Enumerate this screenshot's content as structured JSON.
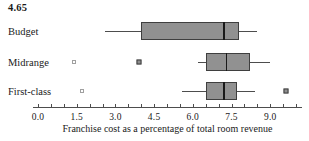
{
  "chart_data": {
    "type": "boxplot",
    "orientation": "horizontal",
    "title": "4.65",
    "xlabel": "Franchise cost as a percentage of total room revenue",
    "xlim": [
      0,
      10.3
    ],
    "x_major_ticks": [
      0.0,
      1.5,
      3.0,
      4.5,
      6.0,
      7.5,
      9.0
    ],
    "x_tick_labels": [
      "0.0",
      "1.5",
      "3.0",
      "4.5",
      "6.0",
      "7.5",
      "9.0"
    ],
    "minor_tick_step": 0.5,
    "grid": false,
    "categories": [
      "Budget",
      "Midrange",
      "First-class"
    ],
    "series": [
      {
        "name": "Budget",
        "whisker_low": 2.6,
        "q1": 4.0,
        "median": 7.2,
        "q3": 7.8,
        "whisker_high": 8.5,
        "outliers_open": [],
        "outliers_filled": []
      },
      {
        "name": "Midrange",
        "whisker_low": 6.2,
        "q1": 6.5,
        "median": 7.3,
        "q3": 8.2,
        "whisker_high": 9.0,
        "outliers_open": [
          1.4
        ],
        "outliers_filled": [
          3.9
        ]
      },
      {
        "name": "First-class",
        "whisker_low": 5.6,
        "q1": 6.5,
        "median": 7.2,
        "q3": 7.7,
        "whisker_high": 8.4,
        "outliers_open": [
          1.7
        ],
        "outliers_filled": [
          9.6
        ]
      }
    ],
    "colors": {
      "background": "#ffffff",
      "text": "#1a1a1a",
      "box_fill": "#919191",
      "box_border": "#3f3f3f",
      "median": "#1a1a1a",
      "whisker": "#4d4d4d",
      "axis": "#4d4d4d",
      "outlier_open_border": "#a0a0a0",
      "outlier_filled": "#8f8f8f"
    }
  }
}
